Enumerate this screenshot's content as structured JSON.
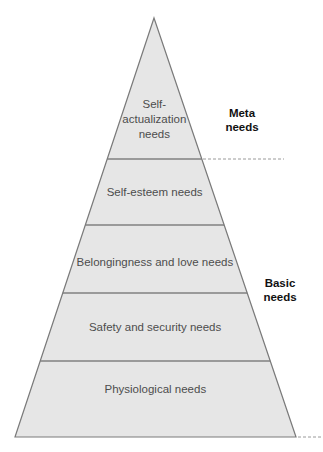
{
  "diagram": {
    "type": "pyramid",
    "colors": {
      "fill": "#e6e6e6",
      "outline": "#7a7a7a",
      "divider": "#808080",
      "label_text": "#4d4d4d",
      "group_text": "#111111",
      "dashed_line": "#9a9a9a"
    },
    "apex": {
      "x": 154,
      "y": 18
    },
    "base": {
      "y": 437,
      "left_x": 15,
      "right_x": 296
    },
    "levels": [
      {
        "id": "self-actualization",
        "label_lines": [
          "Self-",
          "actualization",
          "needs"
        ],
        "top_y": 18,
        "bottom_y": 159,
        "label_y": [
          108,
          123,
          138
        ]
      },
      {
        "id": "self-esteem",
        "label_lines": [
          "Self-esteem needs"
        ],
        "top_y": 159,
        "bottom_y": 225,
        "label_y": [
          196
        ]
      },
      {
        "id": "belongingness",
        "label_lines": [
          "Belongingness and love needs"
        ],
        "top_y": 225,
        "bottom_y": 293,
        "label_y": [
          266
        ]
      },
      {
        "id": "safety",
        "label_lines": [
          "Safety and security needs"
        ],
        "top_y": 293,
        "bottom_y": 361,
        "label_y": [
          331
        ]
      },
      {
        "id": "physiological",
        "label_lines": [
          "Physiological needs"
        ],
        "top_y": 361,
        "bottom_y": 437,
        "label_y": [
          393
        ]
      }
    ],
    "groups": [
      {
        "id": "meta",
        "label_lines": [
          "Meta",
          "needs"
        ],
        "x": 242,
        "y": [
          117,
          131
        ],
        "divider": {
          "y": 159,
          "x_from": 203,
          "x_to": 284
        }
      },
      {
        "id": "basic",
        "label_lines": [
          "Basic",
          "needs"
        ],
        "x": 280,
        "y": [
          287,
          301
        ],
        "divider": {
          "y": 437,
          "x_from": 298,
          "x_to": 323
        }
      }
    ]
  }
}
